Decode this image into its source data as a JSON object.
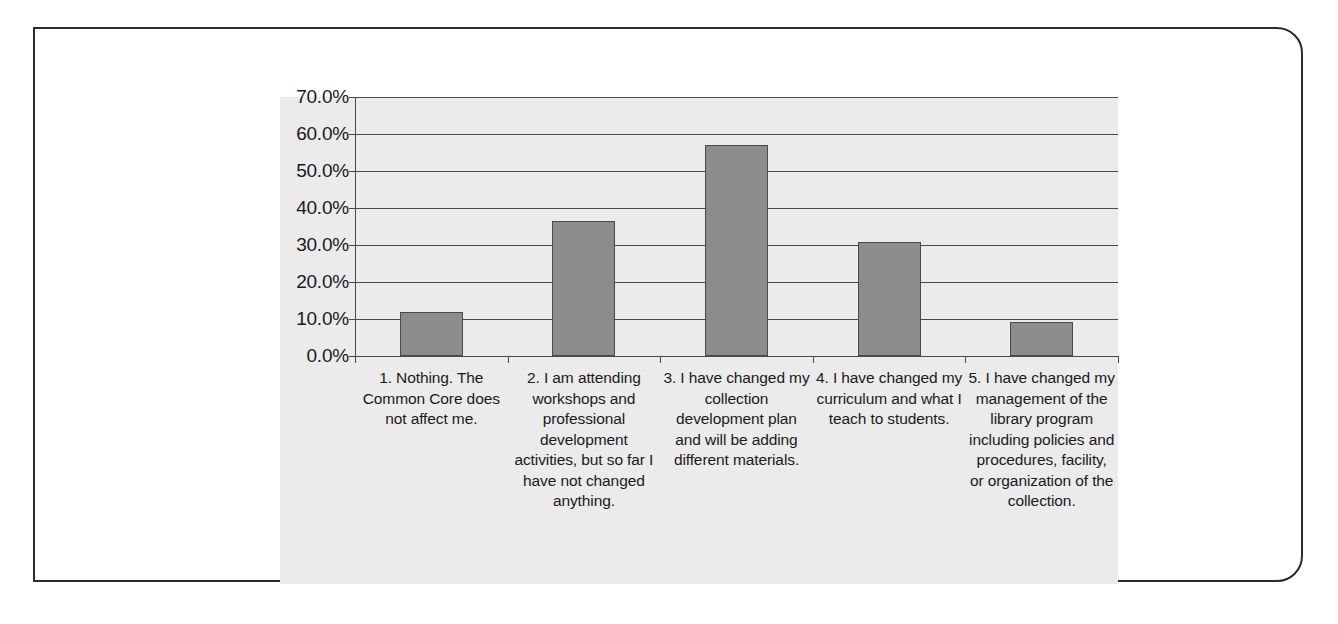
{
  "chart_data": {
    "type": "bar",
    "title": "",
    "subtitle": "",
    "xlabel": "",
    "ylabel": "",
    "ylim": [
      0,
      70
    ],
    "grid": true,
    "legend": false,
    "y_tick_labels": [
      "70.0%",
      "60.0%",
      "50.0%",
      "40.0%",
      "30.0%",
      "20.0%",
      "10.0%",
      "0.0%"
    ],
    "y_tick_values": [
      70,
      60,
      50,
      40,
      30,
      20,
      10,
      0
    ],
    "categories": [
      "1. Nothing. The Common Core does not affect me.",
      "2. I am attending workshops and professional development activities, but so far I have not changed anything.",
      "3. I have changed my collection development plan and will be adding different materials.",
      "4. I have changed my curriculum and what I teach to students.",
      "5. I have changed my management of the library program including policies and procedures, facility, or organization of the collection."
    ],
    "values": [
      11.9,
      36.4,
      57.0,
      30.7,
      9.3
    ],
    "value_labels": [
      "11.9%",
      "36.4%",
      "57.0%",
      "30.7%",
      "9.3%"
    ],
    "series_name": "Responses",
    "bar_color": "#8c8c8c",
    "bar_border_color": "#4a4a4a",
    "plot_background_color": "#ebebeb",
    "grid_color": "#4a4a4a",
    "axis_color": "#4a4a4a"
  },
  "frame": {
    "border_color": "#2b2b2b",
    "background_color": "#ffffff"
  }
}
